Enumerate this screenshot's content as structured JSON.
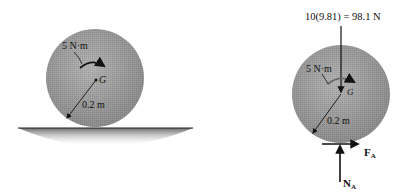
{
  "figure": {
    "left_panel": {
      "title": "Disk on ground",
      "moment_label": "5 N·m",
      "center_label": "G",
      "radius_label": "0.2 m"
    },
    "right_panel": {
      "title": "Free-body diagram",
      "weight_label": "10(9.81) = 98.1 N",
      "moment_label": "5 N·m",
      "center_label": "G",
      "radius_label": "0.2 m",
      "friction_label": "F",
      "friction_sub": "A",
      "normal_label": "N",
      "normal_sub": "A"
    },
    "colors": {
      "disk_fill": "#a8a8a8",
      "disk_shade": "#8c8c8c",
      "ground": "#7a7a7a",
      "ink": "#111111"
    }
  }
}
